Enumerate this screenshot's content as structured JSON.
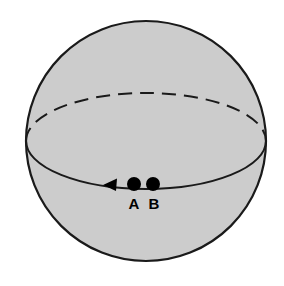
{
  "figure": {
    "kind": "sphere-with-equator-diagram",
    "background_color": "#ffffff",
    "title": ""
  },
  "sphere": {
    "name": "sphere",
    "center_x": 146,
    "center_y": 141,
    "radius": 120,
    "fill_color": "#cccccc",
    "outline_color": "#1a1a1a",
    "outline_width": 2.2
  },
  "equator": {
    "name": "equator-ellipse",
    "center_x": 146,
    "center_y": 141,
    "rx": 120,
    "ry": 48,
    "front_style": "solid",
    "back_style": "dashed",
    "dash_pattern": "14 8",
    "stroke_color": "#1a1a1a",
    "stroke_width": 2.0
  },
  "arrow": {
    "name": "direction-arrow",
    "direction": "left",
    "tip_x": 103,
    "tip_y": 185,
    "size": 11,
    "color": "#000000"
  },
  "points": [
    {
      "id": "A",
      "label": "A",
      "x": 134,
      "y": 184,
      "radius": 7,
      "color": "#000000",
      "label_x": 134,
      "label_y": 209
    },
    {
      "id": "B",
      "label": "B",
      "x": 153,
      "y": 184,
      "radius": 7,
      "color": "#000000",
      "label_x": 154,
      "label_y": 209
    }
  ],
  "colors": {
    "sphere_fill": "#cccccc",
    "line": "#1a1a1a",
    "marker": "#000000",
    "background": "#ffffff"
  }
}
